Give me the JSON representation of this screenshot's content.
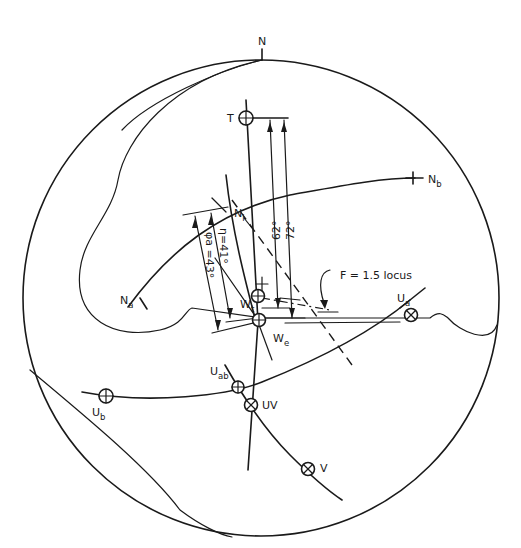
{
  "figure": {
    "type": "stereographic projection",
    "north_label": "N",
    "points": {
      "T": {
        "label": "T",
        "symbol": "circle-plus"
      },
      "Ni": {
        "label": "N",
        "subscript": "i"
      },
      "Na": {
        "label": "N",
        "subscript": "a"
      },
      "Nb": {
        "label": "N",
        "subscript": "b"
      },
      "Wt": {
        "label": "W",
        "subscript": "t",
        "symbol": "circle-plus"
      },
      "We": {
        "label": "W",
        "subscript": "e",
        "symbol": "circle-plus"
      },
      "Ua": {
        "label": "U",
        "subscript": "a",
        "symbol": "circle-cross"
      },
      "Uab": {
        "label": "U",
        "subscript": "ab",
        "symbol": "circle-plus"
      },
      "Ub": {
        "label": "U",
        "subscript": "b",
        "symbol": "circle-plus"
      },
      "UV": {
        "label": "UV",
        "symbol": "circle-cross"
      },
      "V": {
        "label": "V",
        "symbol": "circle-cross"
      }
    },
    "angles": {
      "phi_a": "φa =43°",
      "eta": "η=41°",
      "a62": "62°",
      "a72": "72°"
    },
    "locus_label": "F = 1.5 locus"
  }
}
